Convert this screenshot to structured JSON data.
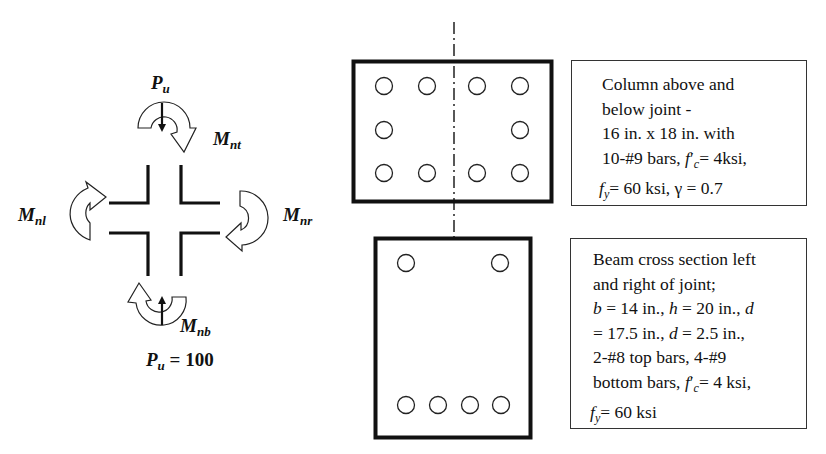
{
  "joint_free_body": {
    "axial_top_label": {
      "symbol": "P",
      "subscript": "u"
    },
    "moment_top_label": {
      "symbol": "M",
      "subscript": "nt"
    },
    "moment_left_label": {
      "symbol": "M",
      "subscript": "nl"
    },
    "moment_right_label": {
      "symbol": "M",
      "subscript": "nr"
    },
    "moment_bottom_label": {
      "symbol": "M",
      "subscript": "nb"
    },
    "axial_bottom_label": {
      "symbol": "P",
      "subscript": "u",
      "equals": "= 100"
    }
  },
  "column_section": {
    "bar_count": 10,
    "bar_layout": "4 top, 2 middle, 4 bottom",
    "note_lines": [
      "Column above and",
      "below joint -",
      "16 in. x 18 in. with"
    ],
    "note_line4": {
      "pre": "10-#9 bars, ",
      "f": "f",
      "prime": "′",
      "sub": "c",
      "post": "= 4ksi,"
    },
    "note_line5": {
      "f": "f",
      "sub": "y",
      "post": "= 60 ksi, γ = 0.7"
    }
  },
  "beam_section": {
    "top_bars": 2,
    "bottom_bars": 4,
    "note_lines": [
      "Beam cross section left",
      "and right of joint;"
    ],
    "note_line3": {
      "b": "b",
      "b_val": " = 14 in., ",
      "h": "h",
      "h_val": " = 20 in., ",
      "d": "d"
    },
    "note_line4": {
      "pre": "= 17.5 in., ",
      "d": "d",
      "post": " = 2.5 in.,"
    },
    "note_line5": "2-#8 top bars, 4-#9",
    "note_line6": {
      "pre": "bottom bars, ",
      "f": "f",
      "prime": "′",
      "sub": "c",
      "post": "= 4 ksi,"
    },
    "note_line7": {
      "f": "f",
      "sub": "y",
      "post": "= 60 ksi"
    }
  },
  "colors": {
    "line": "#111111",
    "box_border": "#333333",
    "background": "#ffffff"
  }
}
